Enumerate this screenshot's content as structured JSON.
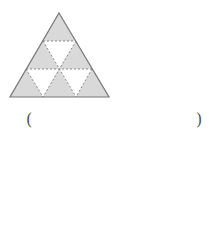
{
  "figure": {
    "colors": {
      "shaded": "#d9d9d9",
      "unshaded": "#ffffff",
      "outline": "#777777",
      "dashed": "#888888"
    },
    "shaded_count": 6,
    "unshaded_count": 3,
    "total_small_triangles": 9
  },
  "answer": {
    "open_paren": "(",
    "close_paren": ")",
    "blank": ""
  }
}
